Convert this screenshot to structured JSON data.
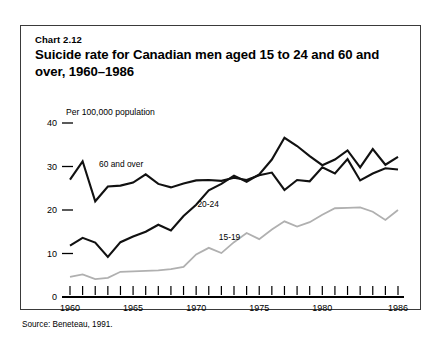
{
  "figure": {
    "chart_number": "Chart 2.12",
    "title": "Suicide rate for Canadian men aged 15 to 24 and 60 and over, 1960–1986",
    "unit_label": "Per 100,000 population",
    "source": "Source: Beneteau, 1991."
  },
  "chart_data": {
    "type": "line",
    "title": "Suicide rate for Canadian men aged 15 to 24 and 60 and over, 1960–1986",
    "xlabel": "",
    "ylabel": "Per 100,000 population",
    "xlim": [
      1960,
      1986
    ],
    "ylim": [
      0,
      40
    ],
    "grid": false,
    "legend": "inline-annotations",
    "yticks": [
      0,
      10,
      20,
      30,
      40
    ],
    "ytick_labels": [
      "0",
      "10",
      "20",
      "30",
      "40"
    ],
    "xticks": [
      1960,
      1961,
      1962,
      1963,
      1964,
      1965,
      1966,
      1967,
      1968,
      1969,
      1970,
      1971,
      1972,
      1973,
      1974,
      1975,
      1976,
      1977,
      1978,
      1979,
      1980,
      1981,
      1982,
      1983,
      1984,
      1985,
      1986
    ],
    "xtick_labels_shown": [
      "1960",
      "1965",
      "1970",
      "1975",
      "1980",
      "1986"
    ],
    "x": [
      1960,
      1961,
      1962,
      1963,
      1964,
      1965,
      1966,
      1967,
      1968,
      1969,
      1970,
      1971,
      1972,
      1973,
      1974,
      1975,
      1976,
      1977,
      1978,
      1979,
      1980,
      1981,
      1982,
      1983,
      1984,
      1985,
      1986
    ],
    "series": [
      {
        "name": "60 and over",
        "color": "#111111",
        "label_text": "60 and over",
        "values": [
          27.0,
          31.2,
          22.0,
          25.4,
          25.6,
          26.3,
          28.2,
          26.0,
          25.2,
          26.1,
          26.8,
          26.9,
          26.7,
          27.4,
          26.9,
          28.0,
          28.6,
          24.6,
          26.9,
          26.6,
          29.8,
          28.4,
          31.7,
          26.8,
          28.4,
          29.6,
          29.3
        ]
      },
      {
        "name": "20-24",
        "color": "#111111",
        "label_text": "20-24",
        "values": [
          11.8,
          13.6,
          12.5,
          9.2,
          12.6,
          13.9,
          15.0,
          16.6,
          15.3,
          18.6,
          21.2,
          24.5,
          26.0,
          27.9,
          26.5,
          28.2,
          31.6,
          36.6,
          34.7,
          32.4,
          30.3,
          31.6,
          33.7,
          29.8,
          34.0,
          30.4,
          32.2
        ]
      },
      {
        "name": "15-19",
        "color": "#b0b0b0",
        "label_text": "15-19",
        "values": [
          4.6,
          5.2,
          4.1,
          4.4,
          5.8,
          5.9,
          6.0,
          6.1,
          6.4,
          6.9,
          9.8,
          11.3,
          10.1,
          12.6,
          14.7,
          13.3,
          15.5,
          17.4,
          16.2,
          17.2,
          18.9,
          20.4,
          20.5,
          20.6,
          19.6,
          17.7,
          20.0
        ]
      }
    ],
    "annotations": [
      {
        "text": "60 and over",
        "x": 1962.3,
        "y": 30.0
      },
      {
        "text": "20-24",
        "x": 1970.1,
        "y": 20.6
      },
      {
        "text": "15-19",
        "x": 1971.8,
        "y": 13.2
      }
    ]
  }
}
